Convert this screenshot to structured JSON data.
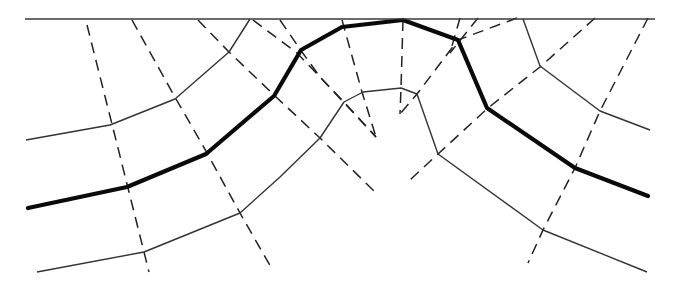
{
  "diagram": {
    "colors": {
      "background": "#ffffff",
      "surface": "#3a3a3a",
      "thin_curve": "#333333",
      "bold_curve": "#0a0a0a",
      "ray": "#222222"
    },
    "surface": {
      "points": [
        [
          25,
          19
        ],
        [
          655,
          19
        ]
      ]
    },
    "bold_wavefront": {
      "points": [
        [
          28,
          208
        ],
        [
          127,
          187
        ],
        [
          206,
          154
        ],
        [
          274,
          96
        ],
        [
          301,
          50
        ],
        [
          342,
          27
        ],
        [
          403,
          20
        ],
        [
          458,
          40
        ],
        [
          487,
          108
        ],
        [
          575,
          168
        ],
        [
          648,
          196
        ]
      ]
    },
    "thin_curves": [
      {
        "name": "upper-left-curve",
        "points": [
          [
            26,
            140
          ],
          [
            110,
            125
          ],
          [
            175,
            99
          ],
          [
            229,
            52
          ],
          [
            250,
            19
          ]
        ]
      },
      {
        "name": "upper-right-curve",
        "points": [
          [
            523,
            19
          ],
          [
            540,
            66
          ],
          [
            600,
            111
          ],
          [
            650,
            130
          ]
        ]
      },
      {
        "name": "lower-curve",
        "points": [
          [
            37,
            272
          ],
          [
            144,
            252
          ],
          [
            240,
            213
          ],
          [
            280,
            177
          ],
          [
            320,
            138
          ],
          [
            344,
            102
          ],
          [
            363,
            92
          ],
          [
            401,
            88
          ],
          [
            417,
            94
          ],
          [
            438,
            154
          ],
          [
            543,
            230
          ],
          [
            647,
            272
          ]
        ]
      }
    ],
    "rays": [
      {
        "name": "ray-1",
        "points": [
          [
            87,
            25
          ],
          [
            117,
            144
          ],
          [
            149,
            272
          ]
        ]
      },
      {
        "name": "ray-2",
        "points": [
          [
            132,
            20
          ],
          [
            176,
            99
          ],
          [
            202,
            144
          ],
          [
            240,
            213
          ],
          [
            272,
            269
          ]
        ]
      },
      {
        "name": "ray-3",
        "points": [
          [
            198,
            20
          ],
          [
            229,
            52
          ],
          [
            275,
            96
          ],
          [
            320,
            138
          ],
          [
            375,
            192
          ]
        ]
      },
      {
        "name": "ray-4",
        "points": [
          [
            253,
            20
          ],
          [
            297,
            53
          ],
          [
            344,
            102
          ],
          [
            376,
            137
          ]
        ]
      },
      {
        "name": "ray-5",
        "points": [
          [
            280,
            20
          ],
          [
            302,
            52
          ],
          [
            320,
            77
          ],
          [
            376,
            137
          ]
        ]
      },
      {
        "name": "ray-6",
        "points": [
          [
            342,
            20
          ],
          [
            362,
            92
          ],
          [
            376,
            137
          ]
        ]
      },
      {
        "name": "ray-7",
        "points": [
          [
            403,
            20
          ],
          [
            401,
            88
          ],
          [
            400,
            114
          ]
        ]
      },
      {
        "name": "ray-8",
        "points": [
          [
            460,
            18
          ],
          [
            450,
            53
          ]
        ]
      },
      {
        "name": "ray-9",
        "points": [
          [
            478,
            18
          ],
          [
            450,
            53
          ]
        ]
      },
      {
        "name": "ray-10",
        "points": [
          [
            517,
            18
          ],
          [
            458,
            40
          ],
          [
            417,
            94
          ],
          [
            400,
            114
          ]
        ]
      },
      {
        "name": "ray-11",
        "points": [
          [
            595,
            18
          ],
          [
            540,
            67
          ],
          [
            488,
            108
          ],
          [
            438,
            154
          ],
          [
            410,
            180
          ]
        ]
      },
      {
        "name": "ray-12",
        "points": [
          [
            648,
            18
          ],
          [
            600,
            111
          ],
          [
            575,
            168
          ],
          [
            543,
            230
          ],
          [
            528,
            263
          ]
        ]
      }
    ]
  }
}
